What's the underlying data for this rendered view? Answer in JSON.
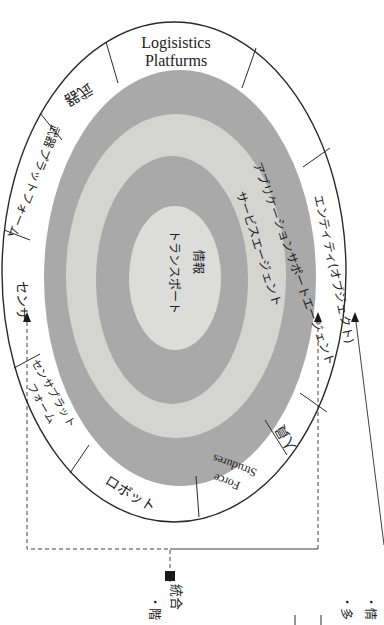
{
  "diagram": {
    "orientation": "rotated 90deg clockwise (page viewed sideways)",
    "colors": {
      "background": "#ffffff",
      "outer_ring": "#ffffff",
      "dark_ring": "#a9a9a9",
      "light_ring": "#d4d4d2",
      "center": "#dcdcda",
      "line": "#2a2a2a",
      "marker": "#1a1a1a"
    },
    "outer_segments": [
      {
        "id": "logistics",
        "label_line1": "Logisistics",
        "label_line2": "Platfurms"
      },
      {
        "id": "blank-top-right",
        "label": ""
      },
      {
        "id": "entity",
        "label": "エンティティ(オブジェクト)"
      },
      {
        "id": "personnel",
        "label": "人員"
      },
      {
        "id": "force-structures",
        "label_line1": "Force",
        "label_line2": "Strudures"
      },
      {
        "id": "robot",
        "label": "ロボット"
      },
      {
        "id": "sensor-platform",
        "label_line1": "センサプラット",
        "label_line2": "フォーム"
      },
      {
        "id": "sensor",
        "label": "センサ"
      },
      {
        "id": "weapon-platform",
        "label": "武器プラットフォーム"
      },
      {
        "id": "weapon",
        "label": "武器"
      }
    ],
    "rings": [
      {
        "id": "application-support",
        "label": "アプリケーションサポートエージェント"
      },
      {
        "id": "service-agent",
        "label": "サービスエージェント"
      },
      {
        "id": "information-transport",
        "label_line1": "情報",
        "label_line2": "トランスポート"
      }
    ],
    "legend": {
      "marker_label": "統合",
      "fragments": [
        "・階",
        "・情",
        "・多"
      ]
    }
  }
}
